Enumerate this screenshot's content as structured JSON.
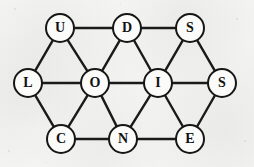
{
  "figure": {
    "kind": "graph-diagram",
    "title": "",
    "background_color": "#f4f4f2",
    "stroke_color": "#1a1a1a",
    "node_fill_color": "#fbfbfa",
    "label_color": "#111111",
    "width": 254,
    "height": 167,
    "node_diameter": 30,
    "edge_width": 2.4
  },
  "chart_data": {
    "type": "graph",
    "title": "",
    "node_count": 11,
    "edge_count": 22,
    "nodes": [
      {
        "id": "U",
        "label": "U",
        "x": 60,
        "y": 28
      },
      {
        "id": "D",
        "label": "D",
        "x": 127,
        "y": 28
      },
      {
        "id": "S1",
        "label": "S",
        "x": 190,
        "y": 28
      },
      {
        "id": "L",
        "label": "L",
        "x": 28,
        "y": 83
      },
      {
        "id": "O",
        "label": "O",
        "x": 95,
        "y": 83
      },
      {
        "id": "I",
        "label": "I",
        "x": 158,
        "y": 83
      },
      {
        "id": "S2",
        "label": "S",
        "x": 222,
        "y": 83
      },
      {
        "id": "C",
        "label": "C",
        "x": 61,
        "y": 139
      },
      {
        "id": "N",
        "label": "N",
        "x": 123,
        "y": 139
      },
      {
        "id": "E",
        "label": "E",
        "x": 190,
        "y": 139
      }
    ],
    "edges": [
      {
        "from": "U",
        "to": "D"
      },
      {
        "from": "D",
        "to": "S1"
      },
      {
        "from": "U",
        "to": "L"
      },
      {
        "from": "U",
        "to": "O"
      },
      {
        "from": "D",
        "to": "O"
      },
      {
        "from": "D",
        "to": "I"
      },
      {
        "from": "S1",
        "to": "I"
      },
      {
        "from": "S1",
        "to": "S2"
      },
      {
        "from": "L",
        "to": "O"
      },
      {
        "from": "O",
        "to": "I"
      },
      {
        "from": "I",
        "to": "S2"
      },
      {
        "from": "L",
        "to": "C"
      },
      {
        "from": "O",
        "to": "C"
      },
      {
        "from": "O",
        "to": "N"
      },
      {
        "from": "I",
        "to": "N"
      },
      {
        "from": "I",
        "to": "E"
      },
      {
        "from": "S2",
        "to": "E"
      },
      {
        "from": "C",
        "to": "N"
      },
      {
        "from": "N",
        "to": "E"
      }
    ],
    "letters_sequence": [
      "U",
      "D",
      "S",
      "L",
      "O",
      "I",
      "S",
      "C",
      "N",
      "E"
    ],
    "layout": "triangular-lattice",
    "directed": false,
    "legend": [],
    "xlabel": "",
    "ylabel": ""
  }
}
